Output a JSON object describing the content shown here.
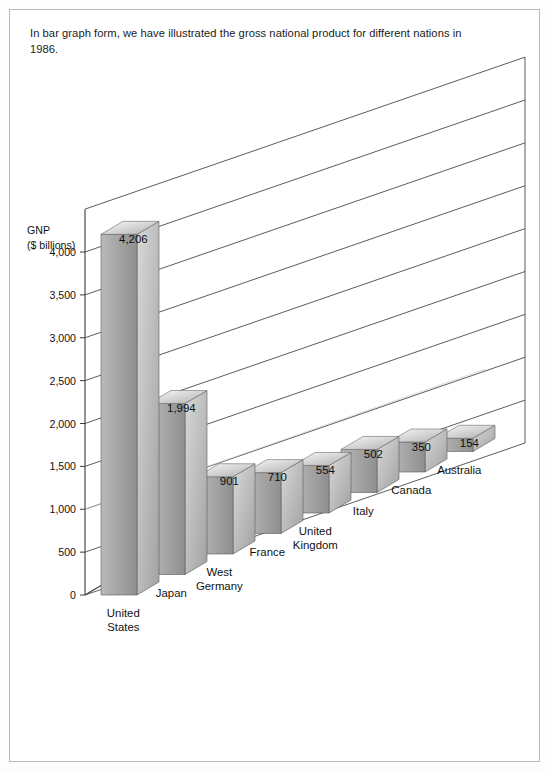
{
  "caption": "In bar graph form, we have illustrated the gross national product for different nations in 1986.",
  "axis": {
    "title_line1": "GNP",
    "title_line2": "($ billions)",
    "ticks": [
      "4,000",
      "3,500",
      "3,000",
      "2,500",
      "2,000",
      "1,500",
      "1,000",
      "500",
      "0"
    ]
  },
  "colors": {
    "bar_front_light": "#b9b9b9",
    "bar_front_dark": "#8f8f8f",
    "bar_side_light": "#d8d8d8",
    "bar_side_dark": "#a2a2a2",
    "bar_top_light": "#fafafa",
    "bar_top_dark": "#b0b0b0",
    "outline": "#4a4a4a",
    "page_border": "#b9b9b9"
  },
  "chart_data": {
    "type": "bar",
    "title": "",
    "subtitle": "",
    "xlabel": "",
    "ylabel": "GNP ($ billions)",
    "ylim": [
      0,
      4500
    ],
    "yticks": [
      0,
      500,
      1000,
      1500,
      2000,
      2500,
      3000,
      3500,
      4000
    ],
    "grid": true,
    "legend": "none",
    "projection": "3d-isometric",
    "categories": [
      "United States",
      "Japan",
      "West Germany",
      "France",
      "United Kingdom",
      "Italy",
      "Canada",
      "Australia"
    ],
    "values": [
      4206,
      1994,
      901,
      710,
      554,
      502,
      350,
      154
    ],
    "value_labels": [
      "4,206",
      "1,994",
      "901",
      "710",
      "554",
      "502",
      "350",
      "154"
    ],
    "category_labels": [
      [
        "United",
        "States"
      ],
      [
        "Japan"
      ],
      [
        "West",
        "Germany"
      ],
      [
        "France"
      ],
      [
        "United",
        "Kingdom"
      ],
      [
        "Italy"
      ],
      [
        "Canada"
      ],
      [
        "Australia"
      ]
    ]
  }
}
